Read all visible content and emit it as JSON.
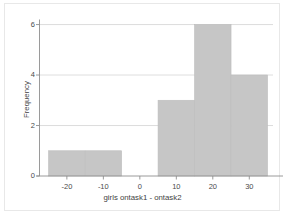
{
  "chart_data": {
    "type": "bar",
    "title": "",
    "subtitle": "",
    "xlabel": "girls ontask1 - ontask2",
    "ylabel": "Frequency",
    "xlim": [
      -27.5,
      36.5
    ],
    "ylim": [
      0,
      6.2
    ],
    "grid": true,
    "grid_axis": "y",
    "legend": null,
    "bin_width": 10,
    "bins": [
      {
        "left": -25,
        "right": -15,
        "value": 1
      },
      {
        "left": -15,
        "right": -5,
        "value": 1
      },
      {
        "left": 5,
        "right": 15,
        "value": 3
      },
      {
        "left": 15,
        "right": 25,
        "value": 6
      },
      {
        "left": 25,
        "right": 35,
        "value": 4
      }
    ],
    "bars": [
      {
        "left": -25,
        "right": -5,
        "height": 1
      },
      {
        "left": 5,
        "right": 15,
        "height": 3
      },
      {
        "left": 15,
        "right": 25,
        "height": 6
      },
      {
        "left": 25,
        "right": 35,
        "height": 4
      }
    ],
    "categories": [
      "-25 to -5",
      "5 to 15",
      "15 to 25",
      "25 to 35"
    ],
    "values": [
      1,
      3,
      6,
      4
    ],
    "xticks": [
      -20,
      -10,
      0,
      10,
      20,
      30
    ],
    "xtick_labels": [
      "-20",
      "-10",
      "0",
      "10",
      "20",
      "30"
    ],
    "yticks": [
      0,
      2,
      4,
      6
    ],
    "ytick_labels": [
      "0",
      "2",
      "4",
      "6"
    ],
    "bar_fill_color": "#c6c6c6",
    "bar_edge_color": "#bdbdbd",
    "grid_color": "#d9d9d9",
    "axis_color": "#8f8f8f",
    "text_color": "#4a4a4a",
    "background_color": "#ffffff"
  }
}
